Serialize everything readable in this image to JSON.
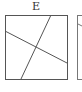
{
  "option": {
    "label": "E"
  },
  "diagram": {
    "square": {
      "x": 5,
      "y": 15,
      "w": 62,
      "h": 64
    },
    "lines": [
      {
        "x1": 5,
        "y1": 31,
        "x2": 67,
        "y2": 63
      },
      {
        "x1": 51,
        "y1": 15,
        "x2": 21,
        "y2": 79
      }
    ],
    "next_square_partial": {
      "x": 77,
      "y": 15,
      "w": 20,
      "h": 64
    },
    "stroke_color": "#555555"
  }
}
